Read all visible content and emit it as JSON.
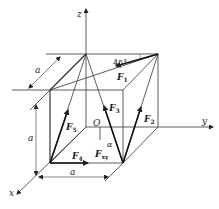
{
  "diagram": {
    "type": "3d-force-system-cube",
    "axes": {
      "x": "x",
      "y": "y",
      "z": "z",
      "origin": "O"
    },
    "dimension_labels": {
      "depth": "a",
      "height": "a",
      "width": "a"
    },
    "angle_labels": {
      "top": "45°",
      "alpha": "α"
    },
    "forces": [
      {
        "name": "F",
        "sub": "1"
      },
      {
        "name": "F",
        "sub": "2"
      },
      {
        "name": "F",
        "sub": "3"
      },
      {
        "name": "F",
        "sub": "4"
      },
      {
        "name": "F",
        "sub": "5"
      },
      {
        "name": "F",
        "sub": "xy"
      }
    ],
    "colors": {
      "line": "#333333",
      "background": "#ffffff"
    }
  }
}
